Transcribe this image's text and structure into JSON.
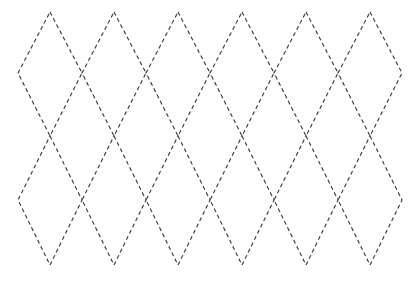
{
  "diagram": {
    "title": "Dashed diamond lattice",
    "width": 418,
    "height": 281,
    "line_color": "#333333",
    "background": "#ffffff",
    "dash": "4 3",
    "grid": {
      "columns": 6,
      "rows": 2,
      "x_start": 18,
      "x_step": 64,
      "y_levels": [
        12,
        73,
        136,
        200,
        265
      ]
    },
    "diamonds": [
      {
        "row": 0,
        "col": 0,
        "top": [
          50,
          12
        ],
        "right": [
          82,
          73
        ],
        "bottom": [
          50,
          136
        ],
        "left": [
          18,
          73
        ]
      },
      {
        "row": 0,
        "col": 1,
        "top": [
          114,
          12
        ],
        "right": [
          146,
          73
        ],
        "bottom": [
          114,
          136
        ],
        "left": [
          82,
          73
        ]
      },
      {
        "row": 0,
        "col": 2,
        "top": [
          178,
          12
        ],
        "right": [
          210,
          73
        ],
        "bottom": [
          178,
          136
        ],
        "left": [
          146,
          73
        ]
      },
      {
        "row": 0,
        "col": 3,
        "top": [
          242,
          12
        ],
        "right": [
          274,
          73
        ],
        "bottom": [
          242,
          136
        ],
        "left": [
          210,
          73
        ]
      },
      {
        "row": 0,
        "col": 4,
        "top": [
          306,
          12
        ],
        "right": [
          338,
          73
        ],
        "bottom": [
          306,
          136
        ],
        "left": [
          274,
          73
        ]
      },
      {
        "row": 0,
        "col": 5,
        "top": [
          370,
          12
        ],
        "right": [
          402,
          73
        ],
        "bottom": [
          370,
          136
        ],
        "left": [
          338,
          73
        ]
      },
      {
        "row": 1,
        "col": 0,
        "top": [
          50,
          136
        ],
        "right": [
          82,
          200
        ],
        "bottom": [
          50,
          265
        ],
        "left": [
          18,
          200
        ]
      },
      {
        "row": 1,
        "col": 1,
        "top": [
          114,
          136
        ],
        "right": [
          146,
          200
        ],
        "bottom": [
          114,
          265
        ],
        "left": [
          82,
          200
        ]
      },
      {
        "row": 1,
        "col": 2,
        "top": [
          178,
          136
        ],
        "right": [
          210,
          200
        ],
        "bottom": [
          178,
          265
        ],
        "left": [
          146,
          200
        ]
      },
      {
        "row": 1,
        "col": 3,
        "top": [
          242,
          136
        ],
        "right": [
          274,
          200
        ],
        "bottom": [
          242,
          265
        ],
        "left": [
          210,
          200
        ]
      },
      {
        "row": 1,
        "col": 4,
        "top": [
          306,
          136
        ],
        "right": [
          338,
          200
        ],
        "bottom": [
          306,
          265
        ],
        "left": [
          274,
          200
        ]
      },
      {
        "row": 1,
        "col": 5,
        "top": [
          370,
          136
        ],
        "right": [
          402,
          200
        ],
        "bottom": [
          370,
          265
        ],
        "left": [
          338,
          200
        ]
      }
    ]
  }
}
